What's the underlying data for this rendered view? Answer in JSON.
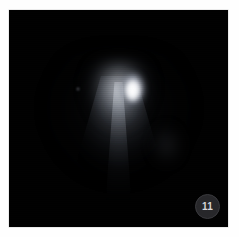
{
  "page": {
    "background_color": "#fefefe"
  },
  "plate": {
    "name": "comet-astrophotograph",
    "background_color": "#010101",
    "subject": "comet",
    "features": [
      {
        "name": "nucleus",
        "description": "bright elongated stellar nucleus",
        "color": "#ffffff"
      },
      {
        "name": "inner-coma",
        "description": "bright rounded inner coma surrounding the nucleus",
        "color": "#e2e5eb"
      },
      {
        "name": "jet",
        "description": "narrow bright jet streaming downward from the nucleus",
        "color": "#f0f2f6"
      },
      {
        "name": "dust-fan",
        "description": "broad fan-shaped dust coma widening toward the bottom",
        "color": "#bec3cd"
      },
      {
        "name": "nebulosity",
        "description": "faint detached nebulosity to the right of the tail",
        "color": "#848a96"
      },
      {
        "name": "field-star",
        "description": "faint point source upper-left of the nucleus",
        "color": "#cdd2da"
      }
    ]
  },
  "badge": {
    "label": "11",
    "background_color": "#27272a",
    "text_color": "#d5d5d8",
    "border_color": "#3a3a3e"
  }
}
